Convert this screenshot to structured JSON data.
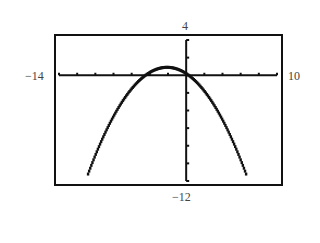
{
  "chart_data": {
    "type": "line",
    "title": "",
    "xlabel": "",
    "ylabel": "",
    "xlim": [
      -14,
      10
    ],
    "ylim": [
      -12,
      4
    ],
    "x_tick_step": 2,
    "y_tick_step": 2,
    "grid": false,
    "window_labels": {
      "xmin": "−14",
      "xmax": "10",
      "ymax": "4",
      "ymin": "−12"
    },
    "series": [
      {
        "name": "parabola",
        "style": "dotted pixel curve",
        "vertex": [
          -2.1,
          0.9
        ],
        "roots_approx": [
          -4.5,
          0.3
        ],
        "equation_approx": "y = -0.16(x + 2.1)^2 + 0.9",
        "x_range": [
          -10.8,
          6.6
        ]
      }
    ]
  },
  "colors": {
    "ink": "#111111",
    "label": "#444444",
    "background": "#ffffff"
  }
}
